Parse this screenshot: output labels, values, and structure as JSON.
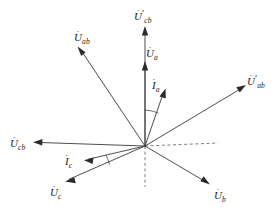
{
  "figure": {
    "type": "phasor-diagram",
    "title": "",
    "background_color": "#ffffff",
    "line_color": "#3a3a3a",
    "dashed_color": "#6e6e6e",
    "width": 278,
    "height": 210,
    "origin": {
      "x": 145,
      "y": 146
    }
  },
  "labels": {
    "u_cb_prime": {
      "symbol": "U",
      "subscript": "cb",
      "prime": "′",
      "dot": "·"
    },
    "u_ab": {
      "symbol": "U",
      "subscript": "ab",
      "prime": "",
      "dot": "·"
    },
    "u_a": {
      "symbol": "U",
      "subscript": "a",
      "prime": "",
      "dot": "·"
    },
    "i_a": {
      "symbol": "I",
      "subscript": "a",
      "prime": "",
      "dot": "·"
    },
    "u_ab_prime": {
      "symbol": "U",
      "subscript": "ab",
      "prime": "′",
      "dot": "·"
    },
    "u_cb": {
      "symbol": "U",
      "subscript": "cb",
      "prime": "",
      "dot": "·"
    },
    "i_c": {
      "symbol": "I",
      "subscript": "c",
      "prime": "",
      "dot": "·"
    },
    "u_c": {
      "symbol": "U",
      "subscript": "c",
      "prime": "",
      "dot": "·"
    },
    "u_b": {
      "symbol": "U",
      "subscript": "b",
      "prime": "",
      "dot": "·"
    }
  },
  "vectors": [
    {
      "name": "u-cb-prime-vector",
      "label_key": "u_cb_prime",
      "tip": {
        "x": 145,
        "y": 27
      },
      "angle_deg": 90,
      "length_px": 119,
      "style": "solid"
    },
    {
      "name": "u-a-vector",
      "label_key": "u_a",
      "tip": {
        "x": 145,
        "y": 62
      },
      "angle_deg": 90,
      "length_px": 84,
      "style": "solid"
    },
    {
      "name": "u-ab-vector",
      "label_key": "u_ab",
      "tip": {
        "x": 78,
        "y": 47
      },
      "angle_deg": 125,
      "length_px": 119,
      "style": "solid"
    },
    {
      "name": "i-a-vector",
      "label_key": "i_a",
      "tip": {
        "x": 165,
        "y": 90
      },
      "angle_deg": 70,
      "length_px": 59,
      "style": "solid"
    },
    {
      "name": "u-ab-prime-vector",
      "label_key": "u_ab_prime",
      "tip": {
        "x": 245,
        "y": 86
      },
      "angle_deg": 31,
      "length_px": 118,
      "style": "solid"
    },
    {
      "name": "u-cb-vector",
      "label_key": "u_cb",
      "tip": {
        "x": 34,
        "y": 142
      },
      "angle_deg": 178,
      "length_px": 111,
      "style": "solid"
    },
    {
      "name": "i-c-vector",
      "label_key": "i_c",
      "tip": {
        "x": 85,
        "y": 160
      },
      "angle_deg": 194,
      "length_px": 62,
      "style": "solid"
    },
    {
      "name": "u-c-vector",
      "label_key": "u_c",
      "tip": {
        "x": 66,
        "y": 182
      },
      "angle_deg": 205,
      "length_px": 88,
      "style": "solid"
    },
    {
      "name": "u-b-vector",
      "label_key": "u_b",
      "tip": {
        "x": 209,
        "y": 184
      },
      "angle_deg": -31,
      "length_px": 75,
      "style": "solid"
    }
  ],
  "reference_lines": [
    {
      "name": "horizontal-reference-dashed",
      "from": {
        "x": 145,
        "y": 146
      },
      "to": {
        "x": 218,
        "y": 143
      },
      "style": "dashed"
    },
    {
      "name": "vertical-reference-dashed",
      "from": {
        "x": 145,
        "y": 146
      },
      "to": {
        "x": 145,
        "y": 187
      },
      "style": "dashed"
    }
  ],
  "angle_arcs": [
    {
      "name": "angle-arc-ia-to-vertical",
      "between": [
        "u-a-vector",
        "i-a-vector"
      ],
      "radius_px": 36
    },
    {
      "name": "angle-arc-ic-to-uc",
      "between": [
        "i-c-vector",
        "u-c-vector"
      ],
      "radius_px": 40
    }
  ]
}
